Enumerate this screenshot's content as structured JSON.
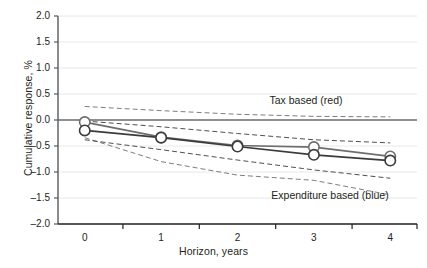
{
  "chart_data": {
    "type": "line",
    "title": "",
    "xlabel": "Horizon, years",
    "ylabel": "Cumulative response, %",
    "xlim": [
      -0.35,
      4.35
    ],
    "ylim": [
      -2.0,
      2.0
    ],
    "yticks": [
      "2.0",
      "1.5",
      "1.0",
      "0.5",
      "0.0",
      "-0.5",
      "-1.0",
      "-1.5",
      "-2.0"
    ],
    "ytick_values": [
      2.0,
      1.5,
      1.0,
      0.5,
      0.0,
      -0.5,
      -1.0,
      -1.5,
      -2.0
    ],
    "xticks": [
      "0",
      "1",
      "2",
      "3",
      "4"
    ],
    "xtick_values": [
      0,
      1,
      2,
      3,
      4
    ],
    "grid": "horizontal",
    "legend_position": "inline-annotation",
    "x": [
      0,
      1,
      2,
      3,
      4
    ],
    "series": [
      {
        "name": "Tax based (red)",
        "color": "#6d6e71",
        "marker": "open-circle",
        "values": [
          -0.04,
          -0.33,
          -0.49,
          -0.52,
          -0.7
        ],
        "ci_upper": [
          0.26,
          0.18,
          0.11,
          0.07,
          0.06
        ],
        "ci_lower": [
          -0.34,
          -0.8,
          -1.06,
          -1.16,
          -1.44
        ]
      },
      {
        "name": "Expenditure based (blue)",
        "color": "#3b3b3d",
        "marker": "open-circle",
        "values": [
          -0.2,
          -0.34,
          -0.51,
          -0.67,
          -0.78
        ],
        "ci_upper": [
          -0.02,
          -0.13,
          -0.26,
          -0.38,
          -0.44
        ],
        "ci_lower": [
          -0.38,
          -0.57,
          -0.77,
          -0.96,
          -1.12
        ]
      }
    ],
    "annotations": [
      {
        "text": "Tax based (red)",
        "x_px": 306,
        "y_px": 100
      },
      {
        "text": "Expenditure based (blue)",
        "x_px": 330,
        "y_px": 195
      }
    ]
  },
  "style": {
    "gridline_color": "#e8e8e9",
    "axis_color": "#58595b",
    "zero_line_color": "#6d6e71",
    "marker_fill": "#ffffff",
    "background": "#ffffff"
  }
}
